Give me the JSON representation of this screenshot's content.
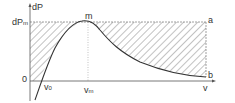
{
  "diagram": {
    "y_axis_label": "dP",
    "x_axis_label": "v",
    "dPm_label": "dP",
    "dPm_sub": "m",
    "origin_label": "0",
    "peak_label": "m",
    "v0_label": "v",
    "v0_sub": "0",
    "vm_label": "v",
    "vm_sub": "m",
    "corner_a": "a",
    "corner_b": "b",
    "line_color": "#333333",
    "hatch_color": "#555555"
  }
}
